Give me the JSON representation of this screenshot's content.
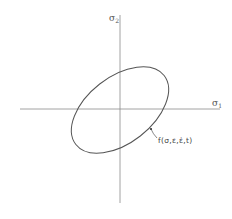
{
  "diagram": {
    "title": "",
    "axes": {
      "horizontal": {
        "symbol": "σ",
        "subscript": "1",
        "label": "σ1"
      },
      "vertical": {
        "symbol": "σ",
        "subscript": "2",
        "label": "σ2"
      }
    },
    "curve": {
      "shape": "ellipse",
      "label": "f(σ,ε,ε̇,t)",
      "description": "Tilted ellipse centered at origin of σ1–σ2 stress plane"
    },
    "colors": {
      "line": "#555555",
      "background": "#ffffff"
    }
  }
}
